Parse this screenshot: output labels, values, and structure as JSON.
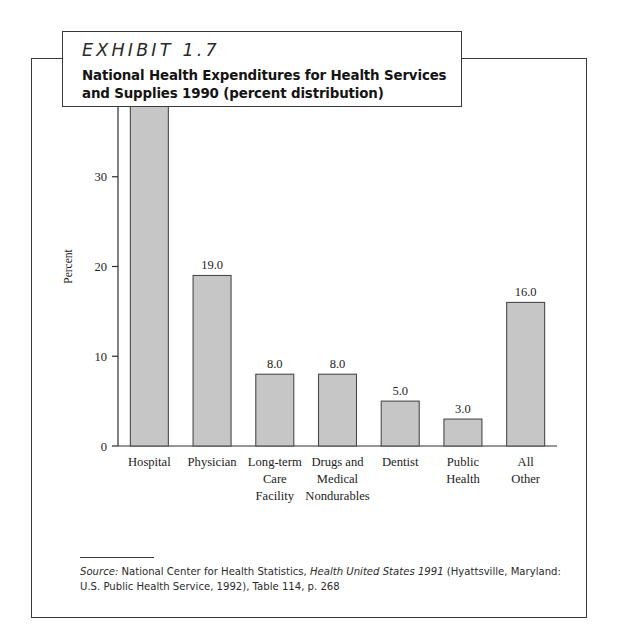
{
  "exhibit": {
    "number_label": "EXHIBIT 1.7",
    "title": "National Health Expenditures for Health Services and Supplies 1990 (percent distribution)"
  },
  "source": {
    "label": "Source:",
    "text_part1": " National Center for Health Statistics, ",
    "publication": "Health United States 1991",
    "text_part2": " (Hyattsville, Maryland: U.S. Public Health Service, 1992), Table 114, p. 268"
  },
  "colors": {
    "bar_fill": "#c6c6c6",
    "bar_stroke": "#4a4a4a",
    "frame": "#3a3a3a",
    "text": "#232323"
  },
  "chart_data": {
    "type": "bar",
    "title": "National Health Expenditures for Health Services and Supplies 1990 (percent distribution)",
    "xlabel": "",
    "ylabel": "Percent",
    "ylim": [
      0,
      40
    ],
    "yticks": [
      0,
      10,
      20,
      30,
      40
    ],
    "ytick_labels": [
      "0",
      "10",
      "20",
      "30",
      "40"
    ],
    "grid": false,
    "legend": false,
    "categories": [
      "Hospital",
      "Physician",
      "Long-term Care Facility",
      "Drugs and Medical Nondurables",
      "Dentist",
      "Public Health",
      "All Other"
    ],
    "category_lines": [
      [
        "Hospital"
      ],
      [
        "Physician"
      ],
      [
        "Long-term",
        "Care",
        "Facility"
      ],
      [
        "Drugs and",
        "Medical",
        "Nondurables"
      ],
      [
        "Dentist"
      ],
      [
        "Public",
        "Health"
      ],
      [
        "All",
        "Other"
      ]
    ],
    "values": [
      38.0,
      19.0,
      8.0,
      8.0,
      5.0,
      3.0,
      16.0
    ],
    "value_labels": [
      "38.0",
      "19.0",
      "8.0",
      "8.0",
      "5.0",
      "3.0",
      "16.0"
    ]
  }
}
